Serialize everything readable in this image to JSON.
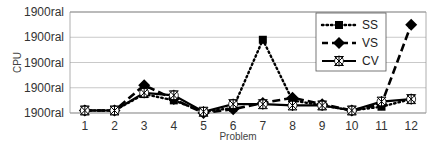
{
  "chart_data": {
    "type": "line",
    "title": "",
    "xlabel": "Problem",
    "ylabel": "CPU",
    "categories": [
      "1",
      "2",
      "3",
      "4",
      "5",
      "6",
      "7",
      "8",
      "9",
      "10",
      "11",
      "12"
    ],
    "y_tick_labels": [
      "1900ral",
      "1900ral",
      "1900ral",
      "1900ral",
      "1900ral"
    ],
    "ylim": [
      0,
      4
    ],
    "grid": true,
    "legend_position": "upper-right-inside",
    "series": [
      {
        "name": "SS",
        "style": "dotted",
        "marker": "square",
        "values": [
          0.1,
          0.1,
          0.75,
          0.5,
          0.05,
          0.2,
          2.9,
          0.5,
          0.3,
          0.1,
          0.25,
          0.55
        ]
      },
      {
        "name": "VS",
        "style": "dashed",
        "marker": "diamond",
        "values": [
          0.1,
          0.1,
          1.1,
          0.55,
          0.0,
          0.15,
          0.4,
          0.6,
          0.35,
          0.1,
          0.35,
          3.5
        ]
      },
      {
        "name": "CV",
        "style": "solid",
        "marker": "asterisk",
        "values": [
          0.1,
          0.1,
          0.8,
          0.7,
          0.05,
          0.35,
          0.35,
          0.3,
          0.3,
          0.1,
          0.45,
          0.55
        ]
      }
    ]
  }
}
